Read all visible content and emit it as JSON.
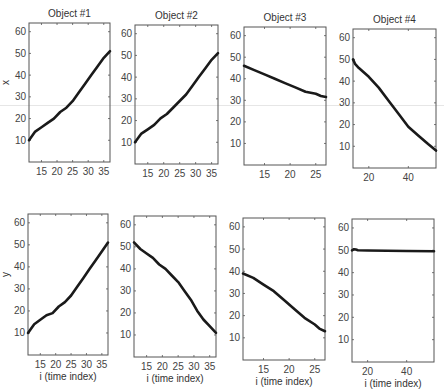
{
  "figure": {
    "row_ylabels": [
      "x",
      "y"
    ],
    "xlabel": "i (time index)",
    "line_color": "#1a1a1a",
    "frame_color": "#555555"
  },
  "chart_data": [
    {
      "type": "line",
      "title": "Object #1",
      "xlabel": "",
      "ylabel": "x",
      "xlim": [
        11,
        37
      ],
      "ylim": [
        0,
        64
      ],
      "xticks": [
        15,
        20,
        25,
        30,
        35
      ],
      "yticks": [
        10,
        20,
        30,
        40,
        50,
        60
      ],
      "x": [
        11,
        13,
        15,
        17,
        19,
        21,
        23,
        25,
        27,
        29,
        31,
        33,
        35,
        37
      ],
      "values": [
        10,
        14,
        16,
        18,
        20,
        23,
        25,
        28,
        32,
        36,
        40,
        44,
        48,
        51
      ]
    },
    {
      "type": "line",
      "title": "Object #2",
      "xlabel": "",
      "ylabel": "",
      "xlim": [
        11,
        37
      ],
      "ylim": [
        0,
        64
      ],
      "xticks": [
        15,
        20,
        25,
        30,
        35
      ],
      "yticks": [
        10,
        20,
        30,
        40,
        50,
        60
      ],
      "x": [
        11,
        13,
        15,
        17,
        19,
        21,
        23,
        25,
        27,
        29,
        31,
        33,
        35,
        37
      ],
      "values": [
        10,
        14,
        16,
        18,
        21,
        23,
        26,
        29,
        32,
        36,
        40,
        44,
        48,
        51
      ]
    },
    {
      "type": "line",
      "title": "Object #3",
      "xlabel": "",
      "ylabel": "",
      "xlim": [
        11,
        27
      ],
      "ylim": [
        0,
        64
      ],
      "xticks": [
        15,
        20,
        25
      ],
      "yticks": [
        10,
        20,
        30,
        40,
        50,
        60
      ],
      "x": [
        11,
        13,
        15,
        17,
        19,
        21,
        23,
        25,
        26,
        27
      ],
      "values": [
        46,
        44,
        42,
        40,
        38,
        36,
        34,
        33,
        32,
        31.5
      ]
    },
    {
      "type": "line",
      "title": "Object #4",
      "xlabel": "",
      "ylabel": "",
      "xlim": [
        12,
        54
      ],
      "ylim": [
        0,
        64
      ],
      "xticks": [
        20,
        40
      ],
      "yticks": [
        10,
        20,
        30,
        40,
        50,
        60
      ],
      "x": [
        12,
        13,
        15,
        20,
        25,
        30,
        35,
        40,
        45,
        50,
        54
      ],
      "values": [
        50,
        48,
        46,
        42,
        37,
        31,
        25,
        19,
        15,
        11,
        8
      ]
    },
    {
      "type": "line",
      "title": "",
      "xlabel": "i (time index)",
      "ylabel": "y",
      "xlim": [
        11,
        37
      ],
      "ylim": [
        0,
        64
      ],
      "xticks": [
        15,
        20,
        25,
        30,
        35
      ],
      "yticks": [
        10,
        20,
        30,
        40,
        50,
        60
      ],
      "x": [
        11,
        13,
        15,
        17,
        19,
        21,
        23,
        25,
        27,
        29,
        31,
        33,
        35,
        37
      ],
      "values": [
        10,
        14,
        16,
        18,
        19,
        22,
        24,
        27,
        31,
        35,
        39,
        43,
        47,
        51
      ]
    },
    {
      "type": "line",
      "title": "",
      "xlabel": "i (time index)",
      "ylabel": "",
      "xlim": [
        11,
        37
      ],
      "ylim": [
        0,
        64
      ],
      "xticks": [
        15,
        20,
        25,
        30,
        35
      ],
      "yticks": [
        10,
        20,
        30,
        40,
        50,
        60
      ],
      "x": [
        11,
        13,
        15,
        17,
        19,
        21,
        23,
        25,
        27,
        29,
        31,
        33,
        35,
        37
      ],
      "values": [
        52,
        49,
        47,
        45,
        42,
        40,
        37,
        34,
        30,
        26,
        21,
        17,
        14,
        11
      ]
    },
    {
      "type": "line",
      "title": "",
      "xlabel": "i (time index)",
      "ylabel": "",
      "xlim": [
        11,
        27
      ],
      "ylim": [
        0,
        64
      ],
      "xticks": [
        15,
        20,
        25
      ],
      "yticks": [
        10,
        20,
        30,
        40,
        50,
        60
      ],
      "x": [
        11,
        13,
        15,
        17,
        19,
        21,
        23,
        25,
        26,
        27
      ],
      "values": [
        39,
        37,
        34,
        31,
        27,
        23,
        19,
        16,
        14,
        13
      ]
    },
    {
      "type": "line",
      "title": "",
      "xlabel": "i (time index)",
      "ylabel": "",
      "xlim": [
        12,
        54
      ],
      "ylim": [
        0,
        64
      ],
      "xticks": [
        20,
        40
      ],
      "yticks": [
        10,
        20,
        30,
        40,
        50,
        60
      ],
      "x": [
        12,
        13,
        14,
        15,
        20,
        30,
        40,
        54
      ],
      "values": [
        50,
        50.5,
        50.3,
        50,
        49.9,
        49.8,
        49.7,
        49.6
      ]
    }
  ]
}
